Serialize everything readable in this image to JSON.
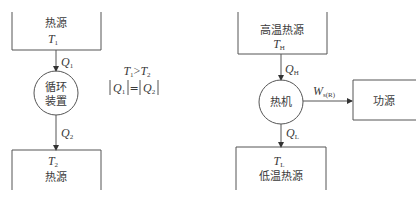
{
  "left_diagram": {
    "hot_source": {
      "label": "热源",
      "temp_symbol": "T",
      "temp_sub": "1"
    },
    "q_in": {
      "symbol": "Q",
      "sub": "1"
    },
    "device": {
      "line1": "循环",
      "line2": "装置"
    },
    "q_out": {
      "symbol": "Q",
      "sub": "2"
    },
    "cold_source": {
      "label": "热源",
      "temp_symbol": "T",
      "temp_sub": "2"
    },
    "relations": {
      "temp_relation": {
        "a": "T",
        "a_sub": "1",
        "op": ">",
        "b": "T",
        "b_sub": "2"
      },
      "heat_relation": {
        "a": "Q",
        "a_sub": "1",
        "op": "=",
        "b": "Q",
        "b_sub": "2"
      }
    }
  },
  "right_diagram": {
    "hot_source": {
      "label": "高温热源",
      "temp_symbol": "T",
      "temp_sub": "H"
    },
    "q_in": {
      "symbol": "Q",
      "sub": "H"
    },
    "engine": {
      "label": "热机"
    },
    "work": {
      "symbol": "W",
      "sub": "s(R)"
    },
    "work_sink": {
      "label": "功源"
    },
    "q_out": {
      "symbol": "Q",
      "sub": "L"
    },
    "cold_source": {
      "label": "低温热源",
      "temp_symbol": "T",
      "temp_sub": "L"
    }
  },
  "colors": {
    "line": "#555555",
    "text": "#3a3a3a",
    "background": "#ffffff"
  }
}
